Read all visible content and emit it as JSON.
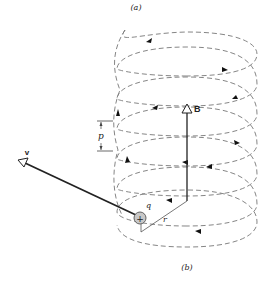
{
  "figure": {
    "caption_top": "(a)",
    "caption_bottom": "(b)",
    "labels": {
      "magnetic_field": "B",
      "velocity": "v",
      "charge": "q",
      "radius": "r",
      "pitch": "p",
      "charge_symbol": "+"
    },
    "colors": {
      "background": "#ffffff",
      "helix_stroke": "#777777",
      "vector_stroke": "#222222",
      "charge_fill": "#c8c8c8"
    },
    "helix": {
      "center_x": 187,
      "radius_x": 70,
      "radius_y": 22,
      "top_y": 54,
      "pitch_px": 30,
      "turns": 6
    }
  }
}
